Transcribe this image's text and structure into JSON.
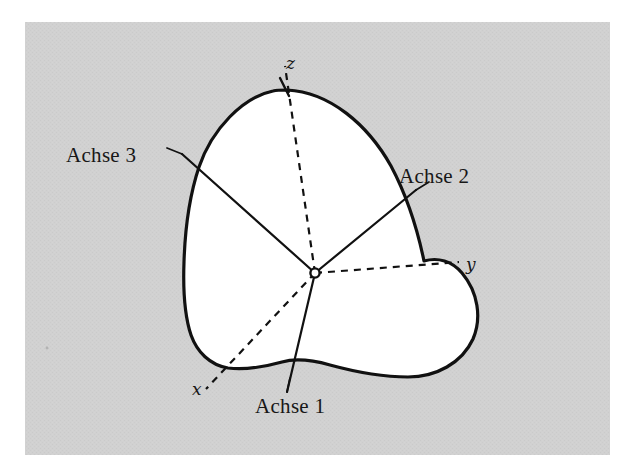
{
  "figure": {
    "kind": "rigid-body-principal-axes-diagram",
    "caption_language": "de",
    "canvas": {
      "width": 632,
      "height": 474
    },
    "plate": {
      "name": "halftone-gray-plate",
      "x": 25,
      "y": 22,
      "width": 585,
      "height": 433,
      "fill": "#cfcfcf",
      "page_background": "#ffffff"
    },
    "body": {
      "name": "rigid-body-blob",
      "fill": "#ffffff",
      "stroke": "#111111",
      "stroke_width": 3.2,
      "outline_path": "M 287 90 C 330 92 368 125 391 166 C 408 198 418 232 424 261 C 438 257 452 261 462 273 C 478 292 482 318 473 339 C 462 363 436 377 408 377 C 380 377 352 371 330 365 C 312 360 296 358 282 362 C 264 367 244 370 228 368 C 210 365 197 352 191 335 C 184 314 183 289 184 262 C 185 230 189 197 199 167 C 212 129 243 97 273 91 C 277 90 282 90 287 90 Z"
    },
    "origin": {
      "name": "origin-point",
      "x": 315,
      "y": 273,
      "radius": 4.6,
      "fill": "#ffffff",
      "stroke": "#111111"
    },
    "labels": {
      "achse1": "Achse 1",
      "achse2": "Achse 2",
      "achse3": "Achse 3",
      "x": "x",
      "y": "y",
      "z": "z"
    },
    "principal_axes": {
      "style": "solid",
      "stroke": "#111111",
      "stroke_width": 2.2,
      "lines": [
        {
          "name": "achse-1",
          "label": "Achse 1",
          "x1": 315,
          "y1": 273,
          "x2": 287,
          "y2": 392
        },
        {
          "name": "achse-2",
          "label": "Achse 2",
          "x1": 315,
          "y1": 273,
          "x2": 416,
          "y2": 190
        },
        {
          "name": "achse-3",
          "label": "Achse 3",
          "x1": 315,
          "y1": 273,
          "x2": 182,
          "y2": 154
        }
      ]
    },
    "coordinate_axes": {
      "style": "dashed",
      "stroke": "#111111",
      "stroke_width": 2.2,
      "dash": "7 6",
      "lines": [
        {
          "name": "axis-x",
          "label": "x",
          "x1": 315,
          "y1": 273,
          "x2": 206,
          "y2": 389
        },
        {
          "name": "axis-y",
          "label": "y",
          "x1": 315,
          "y1": 273,
          "x2": 459,
          "y2": 262
        },
        {
          "name": "axis-z",
          "label": "z",
          "x1": 315,
          "y1": 273,
          "x2": 285,
          "y2": 66
        }
      ]
    },
    "leaders": {
      "stroke": "#111111",
      "stroke_width": 1.7,
      "lines": [
        {
          "name": "leader-achse3",
          "x1": 182,
          "y1": 154,
          "x2": 167,
          "y2": 148
        },
        {
          "name": "leader-achse2",
          "x1": 416,
          "y1": 190,
          "x2": 429,
          "y2": 182
        },
        {
          "name": "leader-achse1",
          "x1": 287,
          "y1": 392,
          "x2": 290,
          "y2": 378
        }
      ]
    },
    "axis_ticks": [
      {
        "name": "tick-z-top",
        "x1": 280,
        "y1": 78,
        "x2": 289,
        "y2": 96
      }
    ]
  }
}
